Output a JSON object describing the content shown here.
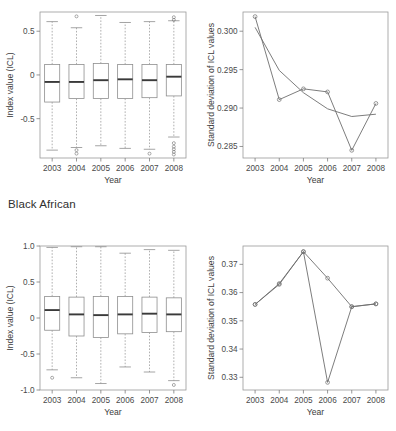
{
  "figure": {
    "group_label": "Black African"
  },
  "chart_data": [
    {
      "id": "top-left",
      "type": "box",
      "title": "",
      "xlabel": "Year",
      "ylabel": "Index value (ICL)",
      "categories": [
        "2003",
        "2004",
        "2005",
        "2006",
        "2007",
        "2008"
      ],
      "ytick_labels": [
        "0.5",
        "0",
        "-0.5"
      ],
      "ytick_values": [
        0.5,
        0,
        -0.5
      ],
      "ylim": [
        -0.95,
        0.72
      ],
      "grid": false,
      "legend": "none",
      "boxes": [
        {
          "category": "2003",
          "whisker_low": -0.86,
          "q1": -0.31,
          "median": -0.08,
          "q3": 0.12,
          "whisker_high": 0.61,
          "outliers": []
        },
        {
          "category": "2004",
          "whisker_low": -0.83,
          "q1": -0.27,
          "median": -0.08,
          "q3": 0.12,
          "whisker_high": 0.54,
          "outliers": [
            0.67,
            -0.86,
            -0.9
          ]
        },
        {
          "category": "2005",
          "whisker_low": -0.81,
          "q1": -0.27,
          "median": -0.06,
          "q3": 0.13,
          "whisker_high": 0.68,
          "outliers": []
        },
        {
          "category": "2006",
          "whisker_low": -0.84,
          "q1": -0.27,
          "median": -0.05,
          "q3": 0.12,
          "whisker_high": 0.6,
          "outliers": []
        },
        {
          "category": "2007",
          "whisker_low": -0.85,
          "q1": -0.26,
          "median": -0.06,
          "q3": 0.12,
          "whisker_high": 0.61,
          "outliers": [
            -0.9
          ]
        },
        {
          "category": "2008",
          "whisker_low": -0.71,
          "q1": -0.24,
          "median": -0.02,
          "q3": 0.12,
          "whisker_high": 0.62,
          "outliers": [
            0.66,
            0.63,
            -0.78,
            -0.82,
            -0.85,
            -0.88,
            -0.91
          ]
        }
      ]
    },
    {
      "id": "top-right",
      "type": "line",
      "title": "",
      "xlabel": "Year",
      "ylabel": "Standard deviation of ICL values",
      "categories": [
        "2003",
        "2004",
        "2005",
        "2006",
        "2007",
        "2008"
      ],
      "ytick_labels": [
        "0.285",
        "0.290",
        "0.295",
        "0.300"
      ],
      "ytick_values": [
        0.285,
        0.29,
        0.295,
        0.3
      ],
      "ylim": [
        0.2835,
        0.3025
      ],
      "grid": false,
      "legend": "none",
      "series": [
        {
          "name": "fitted",
          "marker": "none",
          "values": [
            0.3005,
            0.2949,
            0.292,
            0.2899,
            0.2889,
            0.2892
          ]
        },
        {
          "name": "observed",
          "marker": "circle",
          "values": [
            0.3019,
            0.2911,
            0.2925,
            0.2921,
            0.2845,
            0.2906
          ]
        }
      ]
    },
    {
      "id": "bottom-left",
      "type": "box",
      "title": "",
      "xlabel": "Year",
      "ylabel": "Index value (ICL)",
      "categories": [
        "2003",
        "2004",
        "2005",
        "2006",
        "2007",
        "2008"
      ],
      "ytick_labels": [
        "1.0",
        "0.5",
        "0",
        "-0.5",
        "-1.0"
      ],
      "ytick_values": [
        1.0,
        0.5,
        0,
        -0.5,
        -1.0
      ],
      "ylim": [
        -1.0,
        1.0
      ],
      "grid": false,
      "legend": "none",
      "boxes": [
        {
          "category": "2003",
          "whisker_low": -0.72,
          "q1": -0.17,
          "median": 0.11,
          "q3": 0.3,
          "whisker_high": 0.98,
          "outliers": [
            -0.83
          ]
        },
        {
          "category": "2004",
          "whisker_low": -0.83,
          "q1": -0.25,
          "median": 0.05,
          "q3": 0.29,
          "whisker_high": 0.99,
          "outliers": []
        },
        {
          "category": "2005",
          "whisker_low": -0.91,
          "q1": -0.27,
          "median": 0.04,
          "q3": 0.3,
          "whisker_high": 0.99,
          "outliers": []
        },
        {
          "category": "2006",
          "whisker_low": -0.68,
          "q1": -0.22,
          "median": 0.05,
          "q3": 0.3,
          "whisker_high": 0.9,
          "outliers": []
        },
        {
          "category": "2007",
          "whisker_low": -0.75,
          "q1": -0.2,
          "median": 0.06,
          "q3": 0.29,
          "whisker_high": 0.95,
          "outliers": []
        },
        {
          "category": "2008",
          "whisker_low": -0.87,
          "q1": -0.19,
          "median": 0.05,
          "q3": 0.28,
          "whisker_high": 0.94,
          "outliers": [
            -0.93
          ]
        }
      ]
    },
    {
      "id": "bottom-right",
      "type": "line",
      "title": "",
      "xlabel": "Year",
      "ylabel": "Standard deviation of ICL values",
      "categories": [
        "2003",
        "2004",
        "2005",
        "2006",
        "2007",
        "2008"
      ],
      "ytick_labels": [
        "0.33",
        "0.34",
        "0.35",
        "0.36",
        "0.37"
      ],
      "ytick_values": [
        0.33,
        0.34,
        0.35,
        0.36,
        0.37
      ],
      "ylim": [
        0.3255,
        0.3765
      ],
      "grid": false,
      "legend": "none",
      "series": [
        {
          "name": "fitted",
          "marker": "circle",
          "values": [
            0.3558,
            0.3632,
            0.3745,
            0.3651,
            0.355,
            0.356
          ]
        },
        {
          "name": "observed",
          "marker": "circle",
          "values": [
            0.3558,
            0.3629,
            0.3745,
            0.3282,
            0.355,
            0.356
          ]
        }
      ]
    }
  ]
}
